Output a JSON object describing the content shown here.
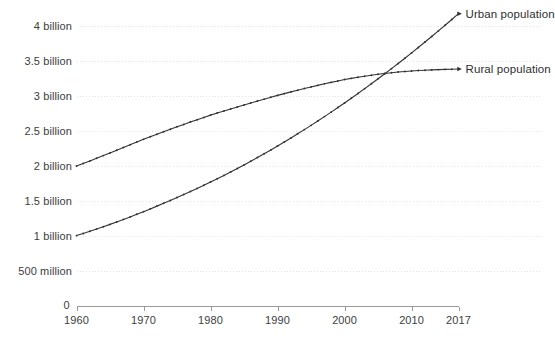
{
  "chart_data": {
    "type": "line",
    "title": "",
    "subtitle": "",
    "xlabel": "",
    "ylabel": "",
    "grid": true,
    "legend_position": "right-of-line-ends",
    "xlim": [
      1960,
      2017
    ],
    "ylim": [
      0,
      4200000000
    ],
    "x_tick_labels": [
      "1960",
      "1970",
      "1980",
      "1990",
      "2000",
      "2010",
      "2017"
    ],
    "x_ticks": [
      1960,
      1970,
      1980,
      1990,
      2000,
      2010,
      2017
    ],
    "y_tick_labels": [
      "0",
      "500 million",
      "1 billion",
      "1.5 billion",
      "2 billion",
      "2.5 billion",
      "3 billion",
      "3.5 billion",
      "4 billion"
    ],
    "y_ticks": [
      0,
      500000000,
      1000000000,
      1500000000,
      2000000000,
      2500000000,
      3000000000,
      3500000000,
      4000000000
    ],
    "x": [
      1960,
      1961,
      1962,
      1963,
      1964,
      1965,
      1966,
      1967,
      1968,
      1969,
      1970,
      1971,
      1972,
      1973,
      1974,
      1975,
      1976,
      1977,
      1978,
      1979,
      1980,
      1981,
      1982,
      1983,
      1984,
      1985,
      1986,
      1987,
      1988,
      1989,
      1990,
      1991,
      1992,
      1993,
      1994,
      1995,
      1996,
      1997,
      1998,
      1999,
      2000,
      2001,
      2002,
      2003,
      2004,
      2005,
      2006,
      2007,
      2008,
      2009,
      2010,
      2011,
      2012,
      2013,
      2014,
      2015,
      2016,
      2017
    ],
    "series": [
      {
        "name": "Rural population",
        "color": "#333333",
        "marker": "dot",
        "label_x": 2017,
        "values": [
          2.008,
          2.043,
          2.08,
          2.118,
          2.156,
          2.194,
          2.232,
          2.271,
          2.31,
          2.349,
          2.388,
          2.425,
          2.461,
          2.497,
          2.532,
          2.567,
          2.601,
          2.635,
          2.668,
          2.701,
          2.734,
          2.764,
          2.793,
          2.822,
          2.851,
          2.879,
          2.907,
          2.935,
          2.962,
          2.989,
          3.016,
          3.041,
          3.066,
          3.09,
          3.114,
          3.137,
          3.159,
          3.181,
          3.202,
          3.222,
          3.242,
          3.259,
          3.275,
          3.29,
          3.304,
          3.317,
          3.329,
          3.34,
          3.35,
          3.358,
          3.365,
          3.371,
          3.376,
          3.38,
          3.384,
          3.387,
          3.39,
          3.392
        ],
        "units": "billions of people"
      },
      {
        "name": "Urban population",
        "color": "#333333",
        "marker": "dot",
        "label_x": 2017,
        "values": [
          1.013,
          1.043,
          1.074,
          1.106,
          1.139,
          1.173,
          1.208,
          1.244,
          1.28,
          1.317,
          1.355,
          1.394,
          1.434,
          1.474,
          1.515,
          1.557,
          1.6,
          1.643,
          1.687,
          1.732,
          1.778,
          1.825,
          1.873,
          1.922,
          1.972,
          2.023,
          2.075,
          2.128,
          2.182,
          2.237,
          2.293,
          2.35,
          2.408,
          2.467,
          2.527,
          2.588,
          2.65,
          2.713,
          2.777,
          2.842,
          2.908,
          2.975,
          3.043,
          3.112,
          3.182,
          3.253,
          3.325,
          3.398,
          3.472,
          3.547,
          3.623,
          3.7,
          3.778,
          3.857,
          3.937,
          4.018,
          4.1,
          4.183
        ],
        "units": "billions of people"
      }
    ],
    "annotations": [
      {
        "text": "Urban population",
        "attached_to": "Urban population",
        "position": "end-of-line"
      },
      {
        "text": "Rural population",
        "attached_to": "Rural population",
        "position": "end-of-line"
      }
    ],
    "axis_color": "#9a9a9a",
    "grid_color": "#e4e4e4",
    "background": "#ffffff"
  },
  "axes": {
    "zero_label": "0",
    "y_labels": [
      {
        "text": "4 billion",
        "value": 4000000000
      },
      {
        "text": "3.5 billion",
        "value": 3500000000
      },
      {
        "text": "3 billion",
        "value": 3000000000
      },
      {
        "text": "2.5 billion",
        "value": 2500000000
      },
      {
        "text": "2 billion",
        "value": 2000000000
      },
      {
        "text": "1.5 billion",
        "value": 1500000000
      },
      {
        "text": "1 billion",
        "value": 1000000000
      },
      {
        "text": "500 million",
        "value": 500000000
      }
    ],
    "x_labels": [
      {
        "text": "1960",
        "value": 1960
      },
      {
        "text": "1970",
        "value": 1970
      },
      {
        "text": "1980",
        "value": 1980
      },
      {
        "text": "1990",
        "value": 1990
      },
      {
        "text": "2000",
        "value": 2000
      },
      {
        "text": "2010",
        "value": 2010
      },
      {
        "text": "2017",
        "value": 2017
      }
    ]
  },
  "legend": {
    "urban": "Urban population",
    "rural": "Rural population"
  }
}
